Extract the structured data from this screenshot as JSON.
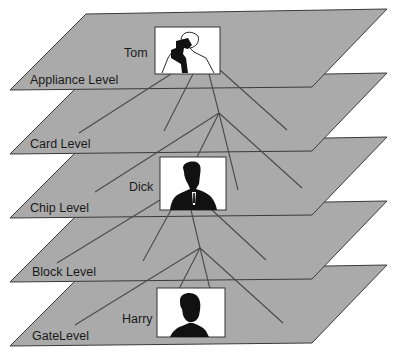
{
  "diagram": {
    "type": "layered-hierarchy",
    "levels": [
      {
        "label": "Appliance Level",
        "person": "Tom"
      },
      {
        "label": "Card Level",
        "person": null
      },
      {
        "label": "Chip Level",
        "person": "Dick"
      },
      {
        "label": "Block Level",
        "person": null
      },
      {
        "label": "GateLevel",
        "person": "Harry"
      }
    ],
    "people": {
      "tom": "Tom",
      "dick": "Dick",
      "harry": "Harry"
    },
    "colors": {
      "plane_fill": "#aaaaaa",
      "plane_edge": "#3a3a3a",
      "connector": "#4a4a4a",
      "photo_bg": "#ffffff"
    }
  }
}
